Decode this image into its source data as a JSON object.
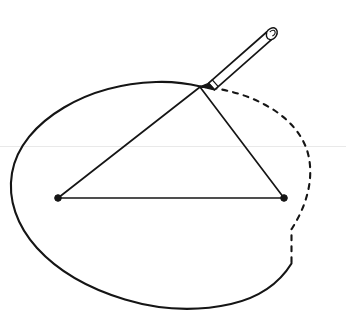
{
  "figure": {
    "canvas": {
      "width": 346,
      "height": 326,
      "background": "#ffffff"
    },
    "ink_color": "#151515",
    "guide_color": "#e9e9e9"
  },
  "chart_data": {
    "type": "diagram",
    "title": "Gardener's construction of an ellipse",
    "xlabel": "",
    "ylabel": "",
    "grid": false,
    "legend": null,
    "ellipse": {
      "center": [
        160,
        197
      ],
      "rx": 149,
      "ry": 113,
      "solid_arc_degrees": [
        195,
        74
      ],
      "dashed_arc_degrees": [
        -74,
        15
      ],
      "stroke_width": 2.1,
      "dash_pattern": "5 6"
    },
    "foci": [
      {
        "name": "left-focus",
        "x": 58,
        "y": 198,
        "radius": 3.3
      },
      {
        "name": "right-focus",
        "x": 284,
        "y": 198,
        "radius": 3.3
      }
    ],
    "pencil_point": {
      "name": "tracing-point",
      "x": 200,
      "y": 87
    },
    "string_segments": [
      {
        "name": "left-string",
        "from": [
          58,
          198
        ],
        "to": [
          200,
          87
        ],
        "stroke_width": 1.7
      },
      {
        "name": "right-string",
        "from": [
          284,
          198
        ],
        "to": [
          200,
          87
        ],
        "stroke_width": 1.7
      },
      {
        "name": "focal-baseline",
        "from": [
          58,
          198
        ],
        "to": [
          284,
          198
        ],
        "stroke_width": 1.7
      }
    ],
    "pencil": {
      "tip": [
        200,
        87
      ],
      "cap_center": [
        268,
        28
      ],
      "length": 90,
      "width": 9,
      "angle_degrees": -41
    },
    "guide_line": {
      "name": "horizon-line",
      "y": 146,
      "x_start": 0,
      "x_end": 346
    }
  },
  "labels": {
    "none": ""
  }
}
